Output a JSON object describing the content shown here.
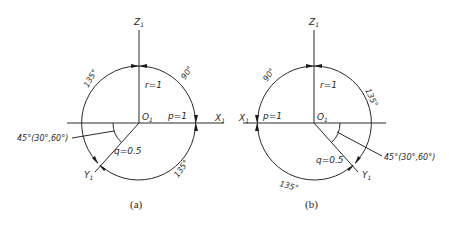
{
  "diagrams": [
    {
      "id": "a",
      "caption": "(a)",
      "axes": {
        "z": "Z",
        "x": "X",
        "y": "Y",
        "origin": "O",
        "subscript": "1"
      },
      "params": {
        "r": "r=1",
        "p": "p=1",
        "q": "q=0.5"
      },
      "angles": {
        "top_left": "135°",
        "top_right": "90°",
        "bottom": "135°",
        "axis_angle": "45°(30°,60°)"
      }
    },
    {
      "id": "b",
      "caption": "(b)",
      "axes": {
        "z": "Z",
        "x": "X",
        "y": "Y",
        "origin": "O",
        "subscript": "1"
      },
      "params": {
        "r": "r=1",
        "p": "p=1",
        "q": "q=0.5"
      },
      "angles": {
        "top_left": "90°",
        "top_right": "135°",
        "bottom": "135°",
        "axis_angle": "45°(30°,60°)"
      }
    }
  ]
}
